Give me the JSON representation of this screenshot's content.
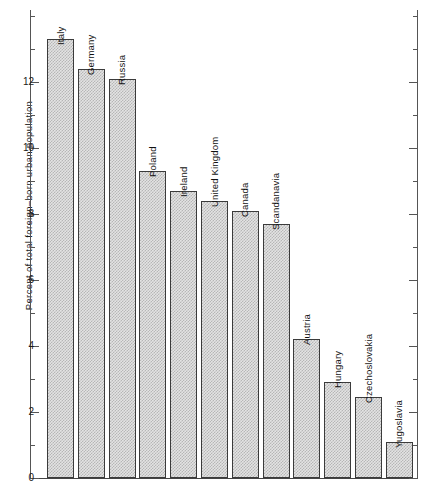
{
  "chart_data": {
    "type": "bar",
    "title": "",
    "xlabel": "",
    "ylabel": "Percent of total foreign–born urban population",
    "ylim": [
      0,
      14
    ],
    "ytick_labels": [
      "0",
      "2",
      "4",
      "6",
      "8",
      "10",
      "12"
    ],
    "ytick_values": [
      0,
      2,
      4,
      6,
      8,
      10,
      12
    ],
    "minor_ticks": [
      1,
      3,
      5,
      7,
      9,
      11,
      13,
      14
    ],
    "grid": false,
    "legend": "none",
    "categories": [
      "Italy",
      "Germany",
      "Russia",
      "Poland",
      "Ireland",
      "United Kingdom",
      "Canada",
      "Scandanavia",
      "Austria",
      "Hungary",
      "Czechoslovakia",
      "Yugoslavia"
    ],
    "values": [
      13.3,
      12.4,
      12.1,
      9.3,
      8.7,
      8.4,
      8.1,
      7.7,
      4.2,
      2.9,
      2.45,
      1.1
    ],
    "bar_fill": "#e3e3e3",
    "bar_pattern": "#b6b6b6",
    "bar_edge": "#3b3b3b"
  }
}
